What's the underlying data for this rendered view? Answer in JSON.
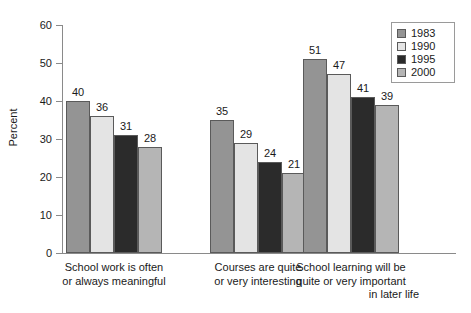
{
  "chart_data": {
    "type": "bar",
    "title": "",
    "subtitle": "",
    "xlabel": "",
    "ylabel": "Percent",
    "ylim": [
      0,
      60
    ],
    "yticks": [
      0,
      10,
      20,
      30,
      40,
      50,
      60
    ],
    "ytick_labels": [
      "0",
      "10",
      "20",
      "30",
      "40",
      "50",
      "60"
    ],
    "grid": false,
    "legend_position": "top-right",
    "categories": [
      "School work is often or always meaningful",
      "Courses are quite or very interesting",
      "School learning will be quite or very important in later life"
    ],
    "category_lines": [
      [
        "School work is often",
        "or always meaningful"
      ],
      [
        "Courses are quite",
        "or very interesting"
      ],
      [
        "School learning will be",
        "quite or very important",
        "in later life"
      ]
    ],
    "series": [
      {
        "name": "1983",
        "color": "#949494",
        "values": [
          40,
          35,
          51
        ]
      },
      {
        "name": "1990",
        "color": "#e4e4e4",
        "values": [
          36,
          29,
          47
        ]
      },
      {
        "name": "1995",
        "color": "#2b2b2b",
        "values": [
          31,
          24,
          41
        ]
      },
      {
        "name": "2000",
        "color": "#b5b5b5",
        "values": [
          28,
          21,
          39
        ]
      }
    ],
    "value_labels": [
      [
        "40",
        "36",
        "31",
        "28"
      ],
      [
        "35",
        "29",
        "24",
        "21"
      ],
      [
        "51",
        "47",
        "41",
        "39"
      ]
    ]
  },
  "legend": {
    "entries": [
      {
        "label": "1983"
      },
      {
        "label": "1990"
      },
      {
        "label": "1995"
      },
      {
        "label": "2000"
      }
    ]
  },
  "axis": {
    "y_title": "Percent",
    "y_labels": [
      "60",
      "50",
      "40",
      "30",
      "20",
      "10",
      "0"
    ]
  }
}
